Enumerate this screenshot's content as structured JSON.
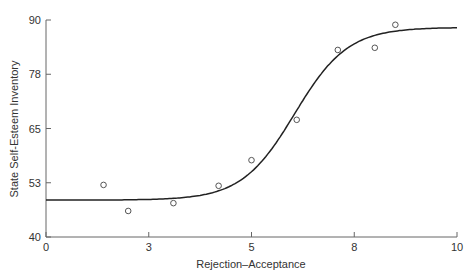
{
  "chart_data": {
    "type": "scatter",
    "title": "",
    "xlabel": "Rejection–Acceptance",
    "ylabel": "State Self-Esteem Inventory",
    "xlim": [
      0,
      10
    ],
    "ylim": [
      40,
      90
    ],
    "x_ticks": [
      "0",
      "3",
      "5",
      "8",
      "10"
    ],
    "x_tick_positions": [
      0,
      2.5,
      5,
      7.5,
      10
    ],
    "y_ticks": [
      "40",
      "53",
      "65",
      "78",
      "90"
    ],
    "y_tick_positions": [
      40,
      52.5,
      65,
      77.5,
      90
    ],
    "grid": false,
    "legend": null,
    "series": [
      {
        "name": "Observed",
        "style": "open-circle",
        "points": [
          {
            "x": 1.4,
            "y": 52.0
          },
          {
            "x": 2.0,
            "y": 46.0
          },
          {
            "x": 3.1,
            "y": 47.8
          },
          {
            "x": 4.2,
            "y": 51.8
          },
          {
            "x": 5.0,
            "y": 57.7
          },
          {
            "x": 6.1,
            "y": 67.0
          },
          {
            "x": 7.1,
            "y": 83.1
          },
          {
            "x": 8.0,
            "y": 83.6
          },
          {
            "x": 8.5,
            "y": 88.9
          }
        ]
      },
      {
        "name": "Fitted curve",
        "style": "line",
        "model": "logistic",
        "lower": 48.5,
        "upper": 88.3,
        "midpoint": 6.05,
        "slope": 1.55
      }
    ]
  }
}
